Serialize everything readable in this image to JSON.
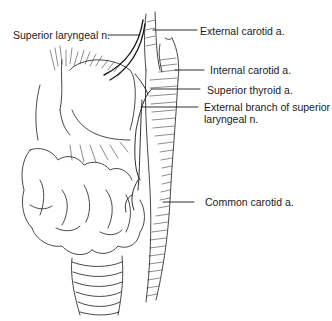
{
  "figure": {
    "type": "anatomical-illustration",
    "style": "black ink line drawing on white",
    "structures": [
      "thyroid gland",
      "larynx",
      "trachea",
      "carotid arteries",
      "superior laryngeal nerve"
    ],
    "colors": {
      "ink": "#1a1a1a",
      "background": "#ffffff"
    }
  },
  "labels": [
    {
      "id": "superior-laryngeal-n",
      "text": "Superior laryngeal n.",
      "side": "left"
    },
    {
      "id": "external-carotid-a",
      "text": "External carotid a.",
      "side": "right"
    },
    {
      "id": "internal-carotid-a",
      "text": "Internal carotid a.",
      "side": "right"
    },
    {
      "id": "superior-thyroid-a",
      "text": "Superior thyroid a.",
      "side": "right"
    },
    {
      "id": "external-branch-superior-laryngeal-n",
      "text": "External branch of superior laryngeal n.",
      "side": "right"
    },
    {
      "id": "common-carotid-a",
      "text": "Common carotid a.",
      "side": "right"
    }
  ]
}
